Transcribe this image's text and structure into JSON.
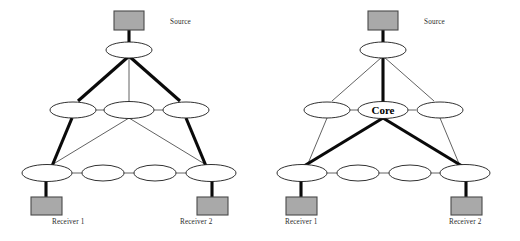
{
  "figure": {
    "background_color": "#ffffff",
    "width": 520,
    "height": 241,
    "colors": {
      "host_fill": "#a9a9a9",
      "host_stroke": "#4a4a4a",
      "node_fill": "#ffffff",
      "node_stroke": "#1a1a1a",
      "thin_link": "#3a3a3a",
      "thick_link": "#0a0a0a",
      "label_text": "#2b2b2b"
    }
  },
  "diagrams": [
    {
      "id": "left",
      "name": "source-based-tree",
      "labels": {
        "source": "Source",
        "receiver_1": "Receiver 1",
        "receiver_2": "Receiver 2"
      },
      "hosts": [
        {
          "name": "source-host",
          "label": "Source"
        },
        {
          "name": "receiver-1-host",
          "label": "Receiver 1"
        },
        {
          "name": "receiver-2-host",
          "label": "Receiver 2"
        }
      ],
      "routers": [
        {
          "name": "router-top",
          "row": "top"
        },
        {
          "name": "router-mid-left",
          "row": "middle"
        },
        {
          "name": "router-mid-center",
          "row": "middle"
        },
        {
          "name": "router-mid-right",
          "row": "middle"
        },
        {
          "name": "router-bottom-1",
          "row": "bottom"
        },
        {
          "name": "router-bottom-2",
          "row": "bottom"
        },
        {
          "name": "router-bottom-3",
          "row": "bottom"
        },
        {
          "name": "router-bottom-4",
          "row": "bottom"
        }
      ],
      "tree_path": "Source to top router, branching left and right through middle routers down to Receiver 1 and Receiver 2"
    },
    {
      "id": "right",
      "name": "core-based-tree",
      "labels": {
        "source": "Source",
        "receiver_1": "Receiver 1",
        "receiver_2": "Receiver 2",
        "core": "Core"
      },
      "hosts": [
        {
          "name": "source-host",
          "label": "Source"
        },
        {
          "name": "receiver-1-host",
          "label": "Receiver 1"
        },
        {
          "name": "receiver-2-host",
          "label": "Receiver 2"
        }
      ],
      "routers": [
        {
          "name": "router-top",
          "row": "top"
        },
        {
          "name": "router-mid-left",
          "row": "middle"
        },
        {
          "name": "router-core",
          "row": "middle",
          "label": "Core"
        },
        {
          "name": "router-mid-right",
          "row": "middle"
        },
        {
          "name": "router-bottom-1",
          "row": "bottom"
        },
        {
          "name": "router-bottom-2",
          "row": "bottom"
        },
        {
          "name": "router-bottom-3",
          "row": "bottom"
        },
        {
          "name": "router-bottom-4",
          "row": "bottom"
        }
      ],
      "tree_path": "Source to top router straight down to Core, then branching to Receiver 1 and Receiver 2"
    }
  ]
}
